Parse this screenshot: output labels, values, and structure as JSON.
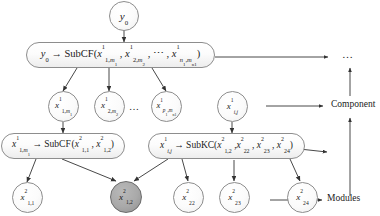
{
  "figure": {
    "colors": {
      "stroke": "#8d8d8d",
      "text": "#1a1a1a",
      "node_fill": "#fbfbfb",
      "highlight_fill": "#a9a9a9",
      "arrow": "#333333"
    }
  },
  "root": {
    "label": "y0",
    "math": "y₀"
  },
  "level1_capsule": {
    "lhs": "y0",
    "operator": "SubCF",
    "args": [
      "x1,m1^1",
      "x2,m2^1",
      "…",
      "xn1,mn1^1"
    ],
    "full": "y₀ → SubCF(x¹₁,ₘ₁ , x¹₂,ₘ₂ , ⋯ , x¹ₙ₁,ₘₙ₁)"
  },
  "level2_nodes": [
    {
      "label": "x1,m1^1",
      "base": "x",
      "sup": "1",
      "sub_main": "1,",
      "sub_sub": "m1"
    },
    {
      "label": "x2,m2^1",
      "base": "x",
      "sup": "1",
      "sub_main": "2,",
      "sub_sub": "m2"
    },
    {
      "label": "xp1,mn1^1",
      "base": "x",
      "sup": "1",
      "sub_main": "p1,",
      "sub_sub": "mn1"
    },
    {
      "label": "xi,j^1",
      "base": "x",
      "sup": "1",
      "sub_main": "i,j",
      "sub_sub": ""
    }
  ],
  "level2_ellipsis": "…",
  "level3_capsules": [
    {
      "lhs": "x1,m1^1",
      "operator": "SubCF",
      "args": [
        "x1,1^2",
        "x1,2^2"
      ],
      "full": "x¹₁,ₘ₁ → SubCF(x²₁,₁ , x²₁,₂)"
    },
    {
      "lhs": "xi,j^1",
      "operator": "SubKC",
      "args": [
        "x1,2^2",
        "x22^2",
        "x23^2",
        "x24^2"
      ],
      "full": "x¹ᵢ,ⱼ → SubKC(x²₁,₂ , x²₂₂ , x²₂₃ , x²₂₄)"
    }
  ],
  "level4_nodes": [
    {
      "label": "x1,1^2",
      "base": "x",
      "sup": "2",
      "sub": "1,1",
      "highlighted": false
    },
    {
      "label": "x1,2^2",
      "base": "x",
      "sup": "2",
      "sub": "1,2",
      "highlighted": true
    },
    {
      "label": "x22^2",
      "base": "x",
      "sup": "2",
      "sub": "22",
      "highlighted": false
    },
    {
      "label": "x23^2",
      "base": "x",
      "sup": "2",
      "sub": "23",
      "highlighted": false
    },
    {
      "label": "x24^2",
      "base": "x",
      "sup": "2",
      "sub": "24",
      "highlighted": false
    }
  ],
  "side_labels": {
    "top_ellipsis": "…",
    "component": "Component",
    "modules": "Modules"
  }
}
